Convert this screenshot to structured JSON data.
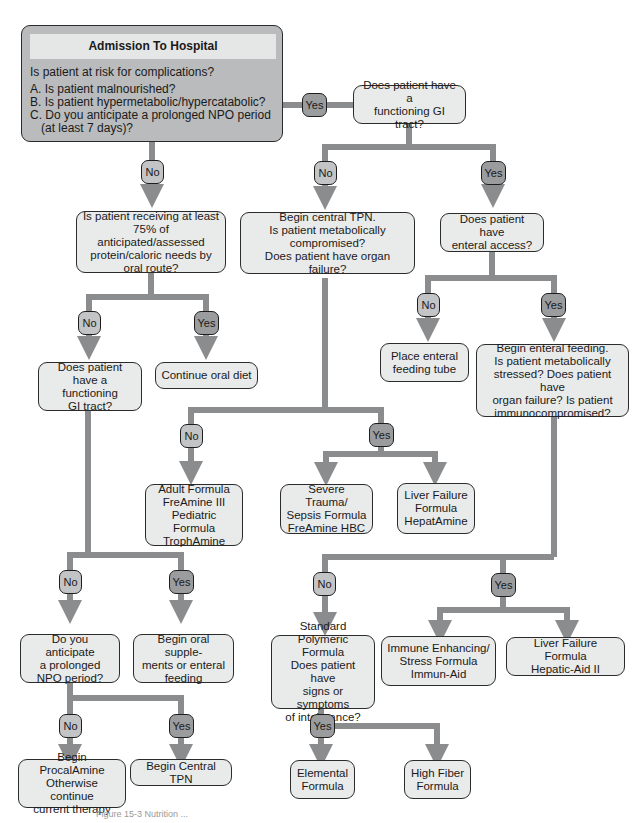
{
  "figure": {
    "colors": {
      "wire": "#8a8c8e",
      "box_fill": "#e9eaea",
      "start_fill": "#b9bbbc",
      "no_badge": "#c2c4c5",
      "yes_badge": "#9a9c9e",
      "border": "#2b2b2b"
    },
    "labels": {
      "yes": "Yes",
      "no": "No"
    },
    "start": {
      "title": "Admission To Hospital",
      "question": "Is patient at risk for complications?",
      "options": [
        "A. Is patient malnourished?",
        "B. Is patient hypermetabolic/hypercatabolic?",
        "C. Do you anticipate a prolonged NPO period",
        "    (at least 7 days)?"
      ]
    },
    "nodes": {
      "functioning_gi_top": [
        "Does patient have a",
        "functioning GI tract?"
      ],
      "oral_75": [
        "Is patient receiving at least",
        "75% of anticipated/assessed",
        "protein/caloric needs by",
        "oral route?"
      ],
      "central_tpn": [
        "Begin central TPN.",
        "Is patient metabolically",
        "compromised?",
        "Does patient have organ failure?"
      ],
      "enteral_access": [
        "Does patient have",
        "enteral access?"
      ],
      "functioning_gi_left": [
        "Does patient",
        "have a functioning",
        "GI tract?"
      ],
      "continue_oral": [
        "Continue oral diet"
      ],
      "place_tube": [
        "Place enteral",
        "feeding tube"
      ],
      "begin_enteral": [
        "Begin enteral feeding.",
        "Is patient metabolically",
        "stressed? Does patient have",
        "organ failure? Is patient",
        "immunocompromised?"
      ],
      "adult_formula": [
        "Adult Formula",
        "FreAmine III",
        "Pediatric Formula",
        "TrophAmine"
      ],
      "severe_trauma": [
        "Severe Trauma/",
        "Sepsis Formula",
        "FreAmine HBC"
      ],
      "liver_failure_hepatamine": [
        "Liver Failure",
        "Formula",
        "HepatAmine"
      ],
      "prolonged_npo": [
        "Do you anticipate",
        "a prolonged",
        "NPO period?"
      ],
      "oral_supplements": [
        "Begin oral supple-",
        "ments or enteral",
        "feeding"
      ],
      "standard_polymeric": [
        "Standard Polymeric",
        "Formula",
        "Does patient have",
        "signs or symptoms",
        "of intolerance?"
      ],
      "immune_enhancing": [
        "Immune Enhancing/",
        "Stress Formula",
        "Immun-Aid"
      ],
      "liver_failure_hepatic_aid": [
        "Liver Failure Formula",
        "Hepatic-Aid II"
      ],
      "procalamine": [
        "Begin ProcalAmine",
        "Otherwise continue",
        "current therapy"
      ],
      "begin_central_tpn": [
        "Begin Central TPN"
      ],
      "elemental": [
        "Elemental",
        "Formula"
      ],
      "high_fiber": [
        "High Fiber",
        "Formula"
      ]
    },
    "caption": "Figure 15-3 Nutrition ..."
  }
}
